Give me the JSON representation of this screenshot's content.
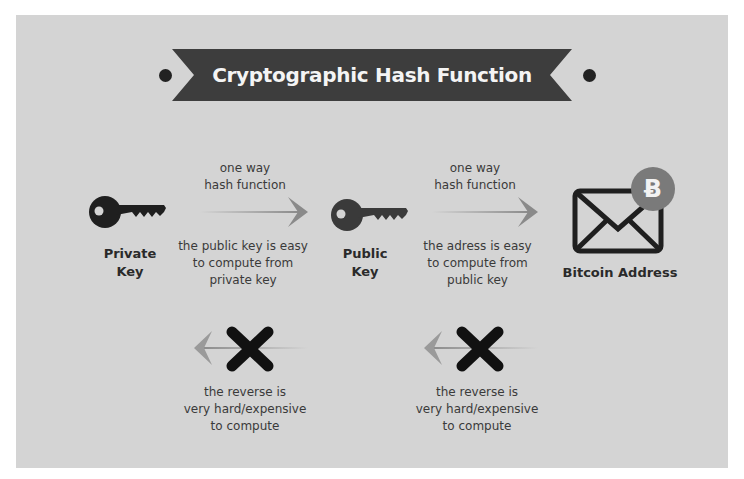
{
  "title": "Cryptographic Hash Function",
  "nodes": [
    {
      "id": "private-key",
      "label_line1": "Private",
      "label_line2": "Key",
      "icon": "key-icon"
    },
    {
      "id": "public-key",
      "label_line1": "Public",
      "label_line2": "Key",
      "icon": "key-icon"
    },
    {
      "id": "bitcoin-address",
      "label": "Bitcoin Address",
      "icon": "envelope-icon",
      "badge": "Ƀ"
    }
  ],
  "forward_arrows": [
    {
      "above_line1": "one way",
      "above_line2": "hash function",
      "below_line1": "the public key is easy",
      "below_line2": "to compute from",
      "below_line3": "private key"
    },
    {
      "above_line1": "one way",
      "above_line2": "hash function",
      "below_line1": "the adress is easy",
      "below_line2": "to compute from",
      "below_line3": "public key"
    }
  ],
  "reverse_arrows": [
    {
      "line1": "the reverse is",
      "line2": "very hard/expensive",
      "line3": "to compute"
    },
    {
      "line1": "the reverse is",
      "line2": "very hard/expensive",
      "line3": "to compute"
    }
  ],
  "colors": {
    "background": "#d4d4d4",
    "banner": "#3d3d3d",
    "banner_text": "#f4f4f4",
    "icon_dark": "#1f1f1f",
    "arrow": "#8a8a8a",
    "badge": "#7a7a7a"
  }
}
